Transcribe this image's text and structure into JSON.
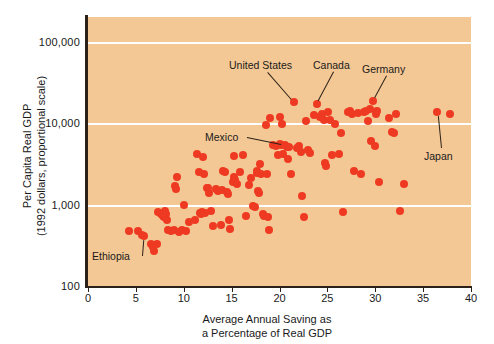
{
  "chart_data": {
    "type": "scatter",
    "title": "",
    "xlabel": "Average Annual Saving as a Percentage of Real GDP",
    "xlabel_line1": "Average Annual Saving as",
    "xlabel_line2": "a Percentage of Real GDP",
    "ylabel": "Per Capita Real GDP (1992 dollars, proportional scale)",
    "ylabel_line1": "Per Capita Real GDP",
    "ylabel_line2": "(1992 dollars, proportional scale)",
    "xlim": [
      0,
      40
    ],
    "ylim": [
      100,
      200000
    ],
    "yscale": "log",
    "xticks": [
      0,
      5,
      10,
      15,
      20,
      25,
      30,
      35,
      40
    ],
    "xticklabels": [
      "0",
      "5",
      "10",
      "15",
      "20",
      "25",
      "30",
      "35",
      "40"
    ],
    "yticks": [
      100,
      1000,
      10000,
      100000
    ],
    "yticklabels": [
      "100",
      "1,000",
      "10,000",
      "100,000"
    ],
    "gridlines_y": [
      1000,
      10000,
      100000
    ],
    "grid": "horizontal-only",
    "legend": "none",
    "marker_color": "#ee3a22",
    "plot_background": "#f4c894",
    "points": [
      [
        4.3,
        470
      ],
      [
        5.2,
        470
      ],
      [
        5.6,
        420
      ],
      [
        5.8,
        405
      ],
      [
        6.6,
        330
      ],
      [
        6.8,
        300
      ],
      [
        6.9,
        272
      ],
      [
        7.2,
        330
      ],
      [
        7.3,
        800
      ],
      [
        7.6,
        760
      ],
      [
        7.8,
        720
      ],
      [
        7.9,
        700
      ],
      [
        8.0,
        835
      ],
      [
        8.1,
        760
      ],
      [
        8.3,
        640
      ],
      [
        8.4,
        480
      ],
      [
        8.7,
        470
      ],
      [
        9.0,
        490
      ],
      [
        9.1,
        1680
      ],
      [
        9.2,
        1570
      ],
      [
        9.3,
        2180
      ],
      [
        9.5,
        455
      ],
      [
        9.8,
        480
      ],
      [
        10.0,
        990
      ],
      [
        10.2,
        470
      ],
      [
        10.6,
        615
      ],
      [
        11.2,
        640
      ],
      [
        11.4,
        4200
      ],
      [
        11.6,
        2530
      ],
      [
        11.7,
        790
      ],
      [
        11.8,
        760
      ],
      [
        11.9,
        820
      ],
      [
        12.0,
        3850
      ],
      [
        12.1,
        2400
      ],
      [
        12.2,
        780
      ],
      [
        12.4,
        1580
      ],
      [
        12.5,
        1600
      ],
      [
        12.6,
        1400
      ],
      [
        12.8,
        830
      ],
      [
        13.1,
        545
      ],
      [
        13.4,
        1560
      ],
      [
        13.6,
        1480
      ],
      [
        13.9,
        560
      ],
      [
        14.0,
        1500
      ],
      [
        14.1,
        2560
      ],
      [
        14.3,
        2480
      ],
      [
        14.5,
        1420
      ],
      [
        14.6,
        1330
      ],
      [
        14.7,
        640
      ],
      [
        14.8,
        500
      ],
      [
        15.1,
        1900
      ],
      [
        15.2,
        2200
      ],
      [
        15.3,
        3900
      ],
      [
        15.4,
        2000
      ],
      [
        15.6,
        1810
      ],
      [
        15.9,
        2480
      ],
      [
        16.2,
        4100
      ],
      [
        16.5,
        720
      ],
      [
        16.8,
        1750
      ],
      [
        17.0,
        2100
      ],
      [
        17.2,
        950
      ],
      [
        17.4,
        930
      ],
      [
        17.6,
        2600
      ],
      [
        17.7,
        2450
      ],
      [
        17.8,
        1450
      ],
      [
        17.9,
        1380
      ],
      [
        18.0,
        3150
      ],
      [
        18.1,
        2350
      ],
      [
        18.3,
        760
      ],
      [
        18.4,
        720
      ],
      [
        18.6,
        9400
      ],
      [
        18.7,
        2400
      ],
      [
        18.8,
        700
      ],
      [
        18.9,
        490
      ],
      [
        19.0,
        11500
      ],
      [
        19.3,
        5400
      ],
      [
        19.6,
        5200
      ],
      [
        19.8,
        4100
      ],
      [
        20.0,
        12000
      ],
      [
        20.1,
        5500
      ],
      [
        20.2,
        5300
      ],
      [
        20.3,
        9800
      ],
      [
        20.4,
        4200
      ],
      [
        20.6,
        5400
      ],
      [
        20.8,
        5100
      ],
      [
        20.9,
        3600
      ],
      [
        21.0,
        5100
      ],
      [
        21.2,
        2400
      ],
      [
        21.5,
        18000
      ],
      [
        21.8,
        5000
      ],
      [
        22.0,
        5200
      ],
      [
        22.2,
        4400
      ],
      [
        22.4,
        1260
      ],
      [
        22.6,
        700
      ],
      [
        22.8,
        10500
      ],
      [
        23.0,
        4700
      ],
      [
        23.2,
        4300
      ],
      [
        23.6,
        12500
      ],
      [
        23.9,
        17000
      ],
      [
        24.2,
        12000
      ],
      [
        24.4,
        13000
      ],
      [
        24.6,
        11000
      ],
      [
        24.8,
        3200
      ],
      [
        24.9,
        3000
      ],
      [
        25.1,
        13500
      ],
      [
        25.3,
        11000
      ],
      [
        25.5,
        4000
      ],
      [
        25.8,
        9800
      ],
      [
        26.2,
        4200
      ],
      [
        26.4,
        7600
      ],
      [
        26.6,
        800
      ],
      [
        27.2,
        13500
      ],
      [
        27.4,
        14200
      ],
      [
        27.6,
        13000
      ],
      [
        27.8,
        2550
      ],
      [
        28.2,
        13200
      ],
      [
        28.5,
        2400
      ],
      [
        28.8,
        13500
      ],
      [
        29.0,
        14000
      ],
      [
        29.2,
        10500
      ],
      [
        29.4,
        15000
      ],
      [
        29.6,
        6000
      ],
      [
        29.8,
        18500
      ],
      [
        30.0,
        5200
      ],
      [
        30.1,
        13000
      ],
      [
        30.2,
        14200
      ],
      [
        30.4,
        1900
      ],
      [
        31.4,
        11500
      ],
      [
        31.8,
        7700
      ],
      [
        32.0,
        7600
      ],
      [
        32.2,
        13000
      ],
      [
        32.6,
        830
      ],
      [
        33.0,
        1800
      ],
      [
        36.5,
        13500
      ],
      [
        37.8,
        13000
      ]
    ],
    "annotations": [
      {
        "label": "United States",
        "x": 21.5,
        "y": 18000
      },
      {
        "label": "Canada",
        "x": 23.9,
        "y": 17000
      },
      {
        "label": "Germany",
        "x": 29.8,
        "y": 18500
      },
      {
        "label": "Mexico",
        "x": 20.6,
        "y": 5400
      },
      {
        "label": "Japan",
        "x": 36.5,
        "y": 13500
      },
      {
        "label": "Ethiopia",
        "x": 5.8,
        "y": 405
      }
    ]
  }
}
